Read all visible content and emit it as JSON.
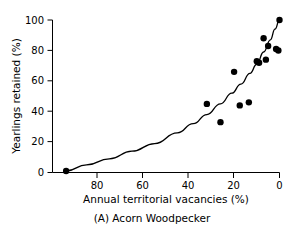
{
  "figure": {
    "caption": "(A) Acorn Woodpecker",
    "panel_label": "(A)",
    "species": "Acorn Woodpecker"
  },
  "chart_data": {
    "type": "scatter",
    "title": "",
    "subtitle": "",
    "caption": "(A) Acorn Woodpecker",
    "xlabel": "Annual territorial vacancies (%)",
    "ylabel": "Yearlings retained (%)",
    "xlim": [
      100,
      0
    ],
    "ylim": [
      0,
      100
    ],
    "x_axis_reversed": true,
    "xticks": [
      80,
      60,
      40,
      20,
      0
    ],
    "xticklabels": [
      "80",
      "60",
      "40",
      "20",
      "0"
    ],
    "yticks": [
      0,
      20,
      40,
      60,
      80,
      100
    ],
    "yticklabels": [
      "0",
      "20",
      "40",
      "60",
      "80",
      "100"
    ],
    "grid": false,
    "legend": false,
    "marker": "filled-circle",
    "marker_color": "#000000",
    "points": [
      {
        "x": 94,
        "y": 1
      },
      {
        "x": 32,
        "y": 45
      },
      {
        "x": 26,
        "y": 33
      },
      {
        "x": 20,
        "y": 66
      },
      {
        "x": 17.5,
        "y": 44
      },
      {
        "x": 13.5,
        "y": 46
      },
      {
        "x": 10,
        "y": 73
      },
      {
        "x": 9,
        "y": 72
      },
      {
        "x": 7,
        "y": 88
      },
      {
        "x": 6,
        "y": 74
      },
      {
        "x": 5,
        "y": 83
      },
      {
        "x": 1.5,
        "y": 81
      },
      {
        "x": 0.5,
        "y": 80
      },
      {
        "x": 0,
        "y": 100
      }
    ],
    "fit_curve": {
      "label": "",
      "color": "#000000",
      "points": [
        {
          "x": 94,
          "y": 1
        },
        {
          "x": 85,
          "y": 5
        },
        {
          "x": 75,
          "y": 9
        },
        {
          "x": 65,
          "y": 14
        },
        {
          "x": 55,
          "y": 19
        },
        {
          "x": 45,
          "y": 26
        },
        {
          "x": 38,
          "y": 32
        },
        {
          "x": 32,
          "y": 38
        },
        {
          "x": 26,
          "y": 45
        },
        {
          "x": 21,
          "y": 52
        },
        {
          "x": 17,
          "y": 58
        },
        {
          "x": 13,
          "y": 65
        },
        {
          "x": 10,
          "y": 71
        },
        {
          "x": 7,
          "y": 79
        },
        {
          "x": 4,
          "y": 87
        },
        {
          "x": 2,
          "y": 94
        },
        {
          "x": 0,
          "y": 100
        }
      ]
    }
  }
}
